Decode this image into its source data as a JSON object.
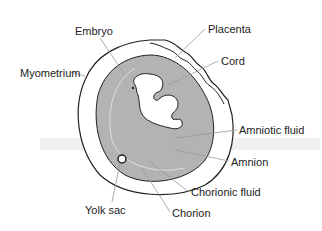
{
  "diagram": {
    "labels": [
      {
        "id": "embryo",
        "text": "Embryo",
        "x": 75,
        "y": 26
      },
      {
        "id": "placenta",
        "text": "Placenta",
        "x": 208,
        "y": 24
      },
      {
        "id": "cord",
        "text": "Cord",
        "x": 221,
        "y": 56
      },
      {
        "id": "myometrium",
        "text": "Myometrium",
        "x": 20,
        "y": 68
      },
      {
        "id": "amniotic-fluid",
        "text": "Amniotic fluid",
        "x": 239,
        "y": 125
      },
      {
        "id": "amnion",
        "text": "Amnion",
        "x": 231,
        "y": 157
      },
      {
        "id": "chorionic-fluid",
        "text": "Chorionic fluid",
        "x": 191,
        "y": 187
      },
      {
        "id": "yolk-sac",
        "text": "Yolk sac",
        "x": 85,
        "y": 205
      },
      {
        "id": "chorion",
        "text": "Chorion",
        "x": 172,
        "y": 208
      }
    ],
    "colors": {
      "amniotic_fill": "#b3b3b3",
      "outline": "#222222",
      "leader": "#999999",
      "shadow": "#e6e6e6"
    }
  }
}
